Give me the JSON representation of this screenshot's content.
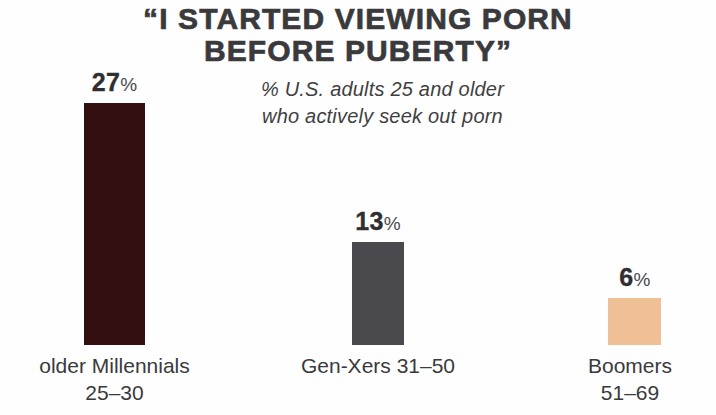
{
  "title": {
    "line1": "“I STARTED VIEWING PORN",
    "line2": "BEFORE PUBERTY”"
  },
  "subtitle": {
    "line1": "% U.S. adults 25 and older",
    "line2": "who actively seek out porn"
  },
  "bars": [
    {
      "value_number": "27",
      "value_percent": "%",
      "label_line1": "older Millennials",
      "label_line2": "25–30",
      "color": "#33100f"
    },
    {
      "value_number": "13",
      "value_percent": "%",
      "label_line1": "Gen-Xers 31–50",
      "label_line2": "",
      "color": "#4a4a4e"
    },
    {
      "value_number": "6",
      "value_percent": "%",
      "label_line1": "Boomers",
      "label_line2": "51–69",
      "color": "#efc096"
    }
  ],
  "chart_data": {
    "type": "bar",
    "title": "“I STARTED VIEWING PORN BEFORE PUBERTY”",
    "subtitle": "% U.S. adults 25 and older who actively seek out porn",
    "categories": [
      "older Millennials 25–30",
      "Gen-Xers 31–50",
      "Boomers 51–69"
    ],
    "values": [
      27,
      13,
      6
    ],
    "value_labels": [
      "27%",
      "13%",
      "6%"
    ],
    "unit": "percent",
    "xlabel": "",
    "ylabel": "",
    "ylim": [
      0,
      27
    ],
    "grid": false,
    "legend": false,
    "bar_colors": [
      "#33100f",
      "#4a4a4e",
      "#efc096"
    ],
    "background": "#fefefe"
  }
}
